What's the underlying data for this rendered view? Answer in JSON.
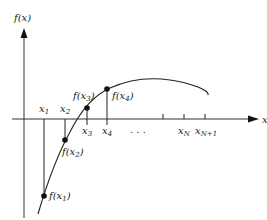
{
  "diagram": {
    "type": "function-plot",
    "y_axis_label": "f(x)",
    "x_axis_label": "x",
    "function_points": [
      {
        "label": "f(x1)",
        "base": "f(x",
        "sub": "1",
        "close": ")"
      },
      {
        "label": "f(x2)",
        "base": "f(x",
        "sub": "2",
        "close": ")"
      },
      {
        "label": "f(x3)",
        "base": "f(x",
        "sub": "3",
        "close": ")"
      },
      {
        "label": "f(x4)",
        "base": "f(x",
        "sub": "4",
        "close": ")"
      }
    ],
    "x_ticks": [
      {
        "label": "x1",
        "base": "x",
        "sub": "1"
      },
      {
        "label": "x2",
        "base": "x",
        "sub": "2"
      },
      {
        "label": "x3",
        "base": "x",
        "sub": "3"
      },
      {
        "label": "x4",
        "base": "x",
        "sub": "4"
      },
      {
        "label": "xN",
        "base": "x",
        "sub": "N"
      },
      {
        "label": "xN+1",
        "base": "x",
        "sub": "N+1"
      }
    ],
    "ellipsis": ". . ."
  }
}
